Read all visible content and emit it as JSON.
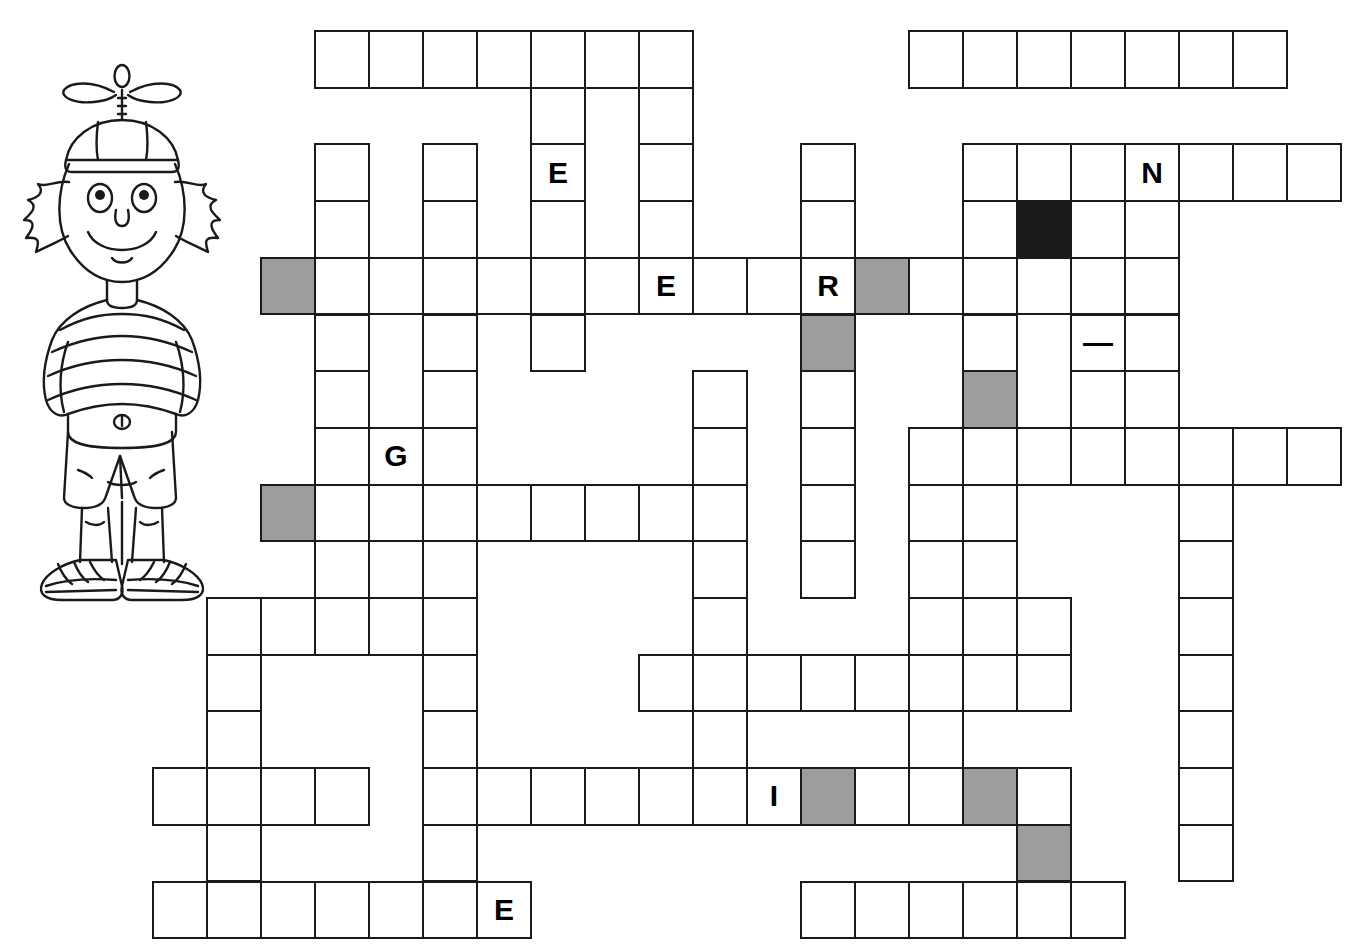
{
  "page": {
    "type": "blank crossword grid with partial letter hints"
  },
  "illustration": {
    "name": "cartoon-boy-with-propeller-hat",
    "description": "Line-art cartoon boy wearing a propeller beanie, striped t-shirt, shorts and sneakers"
  },
  "grid": {
    "cell_size": 54,
    "origin_x": 152,
    "origin_y": 30,
    "columns": 22,
    "rows": 16,
    "colors": {
      "cell_fill": "#ffffff",
      "cell_border": "#1a1a1a",
      "shaded_fill": "#9d9d9d",
      "blocked_fill": "#1a1a1a",
      "letter_color": "#000000"
    },
    "legend": {
      "shaded": "highlighted answer cell",
      "blocked": "blocked cell",
      "open": "empty answer cell"
    },
    "cells": [
      {
        "r": 0,
        "c": 3,
        "s": "open"
      },
      {
        "r": 0,
        "c": 4,
        "s": "open"
      },
      {
        "r": 0,
        "c": 5,
        "s": "open"
      },
      {
        "r": 0,
        "c": 6,
        "s": "open"
      },
      {
        "r": 0,
        "c": 7,
        "s": "open"
      },
      {
        "r": 0,
        "c": 8,
        "s": "open"
      },
      {
        "r": 0,
        "c": 9,
        "s": "open"
      },
      {
        "r": 0,
        "c": 14,
        "s": "open"
      },
      {
        "r": 0,
        "c": 15,
        "s": "open"
      },
      {
        "r": 0,
        "c": 16,
        "s": "open"
      },
      {
        "r": 0,
        "c": 17,
        "s": "open"
      },
      {
        "r": 0,
        "c": 18,
        "s": "open"
      },
      {
        "r": 0,
        "c": 19,
        "s": "open"
      },
      {
        "r": 0,
        "c": 20,
        "s": "open"
      },
      {
        "r": 1,
        "c": 7,
        "s": "open"
      },
      {
        "r": 1,
        "c": 9,
        "s": "open"
      },
      {
        "r": 2,
        "c": 3,
        "s": "open"
      },
      {
        "r": 2,
        "c": 5,
        "s": "open"
      },
      {
        "r": 2,
        "c": 7,
        "s": "open",
        "letter": "E"
      },
      {
        "r": 2,
        "c": 9,
        "s": "open"
      },
      {
        "r": 2,
        "c": 12,
        "s": "open"
      },
      {
        "r": 2,
        "c": 15,
        "s": "open"
      },
      {
        "r": 2,
        "c": 16,
        "s": "open"
      },
      {
        "r": 2,
        "c": 17,
        "s": "open"
      },
      {
        "r": 2,
        "c": 18,
        "s": "open",
        "letter": "N"
      },
      {
        "r": 2,
        "c": 19,
        "s": "open"
      },
      {
        "r": 2,
        "c": 20,
        "s": "open"
      },
      {
        "r": 2,
        "c": 21,
        "s": "open"
      },
      {
        "r": 3,
        "c": 3,
        "s": "open"
      },
      {
        "r": 3,
        "c": 5,
        "s": "open"
      },
      {
        "r": 3,
        "c": 7,
        "s": "open"
      },
      {
        "r": 3,
        "c": 9,
        "s": "open"
      },
      {
        "r": 3,
        "c": 12,
        "s": "open"
      },
      {
        "r": 3,
        "c": 15,
        "s": "open"
      },
      {
        "r": 3,
        "c": 16,
        "s": "blocked"
      },
      {
        "r": 3,
        "c": 17,
        "s": "open"
      },
      {
        "r": 3,
        "c": 18,
        "s": "open"
      },
      {
        "r": 4,
        "c": 2,
        "s": "shaded"
      },
      {
        "r": 4,
        "c": 3,
        "s": "open"
      },
      {
        "r": 4,
        "c": 4,
        "s": "open"
      },
      {
        "r": 4,
        "c": 5,
        "s": "open"
      },
      {
        "r": 4,
        "c": 6,
        "s": "open"
      },
      {
        "r": 4,
        "c": 7,
        "s": "open"
      },
      {
        "r": 4,
        "c": 8,
        "s": "open"
      },
      {
        "r": 4,
        "c": 9,
        "s": "open",
        "letter": "E"
      },
      {
        "r": 4,
        "c": 10,
        "s": "open"
      },
      {
        "r": 4,
        "c": 11,
        "s": "open"
      },
      {
        "r": 4,
        "c": 12,
        "s": "open",
        "letter": "R"
      },
      {
        "r": 4,
        "c": 13,
        "s": "shaded"
      },
      {
        "r": 4,
        "c": 14,
        "s": "open"
      },
      {
        "r": 4,
        "c": 15,
        "s": "open"
      },
      {
        "r": 4,
        "c": 16,
        "s": "open"
      },
      {
        "r": 4,
        "c": 17,
        "s": "open"
      },
      {
        "r": 4,
        "c": 18,
        "s": "open"
      },
      {
        "r": 5,
        "c": 3,
        "s": "open"
      },
      {
        "r": 5,
        "c": 5,
        "s": "open"
      },
      {
        "r": 5,
        "c": 7,
        "s": "open"
      },
      {
        "r": 5,
        "c": 12,
        "s": "shaded"
      },
      {
        "r": 5,
        "c": 15,
        "s": "open"
      },
      {
        "r": 5,
        "c": 17,
        "s": "open",
        "letter": "—"
      },
      {
        "r": 5,
        "c": 18,
        "s": "open"
      },
      {
        "r": 6,
        "c": 3,
        "s": "open"
      },
      {
        "r": 6,
        "c": 5,
        "s": "open"
      },
      {
        "r": 6,
        "c": 10,
        "s": "open"
      },
      {
        "r": 6,
        "c": 12,
        "s": "open"
      },
      {
        "r": 6,
        "c": 15,
        "s": "shaded"
      },
      {
        "r": 6,
        "c": 17,
        "s": "open"
      },
      {
        "r": 6,
        "c": 18,
        "s": "open"
      },
      {
        "r": 7,
        "c": 3,
        "s": "open"
      },
      {
        "r": 7,
        "c": 4,
        "s": "open",
        "letter": "G"
      },
      {
        "r": 7,
        "c": 5,
        "s": "open"
      },
      {
        "r": 7,
        "c": 10,
        "s": "open"
      },
      {
        "r": 7,
        "c": 12,
        "s": "open"
      },
      {
        "r": 7,
        "c": 14,
        "s": "open"
      },
      {
        "r": 7,
        "c": 15,
        "s": "open"
      },
      {
        "r": 7,
        "c": 16,
        "s": "open"
      },
      {
        "r": 7,
        "c": 17,
        "s": "open"
      },
      {
        "r": 7,
        "c": 18,
        "s": "open"
      },
      {
        "r": 7,
        "c": 19,
        "s": "open"
      },
      {
        "r": 7,
        "c": 20,
        "s": "open"
      },
      {
        "r": 7,
        "c": 21,
        "s": "open"
      },
      {
        "r": 8,
        "c": 2,
        "s": "shaded"
      },
      {
        "r": 8,
        "c": 3,
        "s": "open"
      },
      {
        "r": 8,
        "c": 4,
        "s": "open"
      },
      {
        "r": 8,
        "c": 5,
        "s": "open"
      },
      {
        "r": 8,
        "c": 6,
        "s": "open"
      },
      {
        "r": 8,
        "c": 7,
        "s": "open"
      },
      {
        "r": 8,
        "c": 8,
        "s": "open"
      },
      {
        "r": 8,
        "c": 9,
        "s": "open"
      },
      {
        "r": 8,
        "c": 10,
        "s": "open"
      },
      {
        "r": 8,
        "c": 12,
        "s": "open"
      },
      {
        "r": 8,
        "c": 14,
        "s": "open"
      },
      {
        "r": 8,
        "c": 15,
        "s": "open"
      },
      {
        "r": 8,
        "c": 19,
        "s": "open"
      },
      {
        "r": 9,
        "c": 3,
        "s": "open"
      },
      {
        "r": 9,
        "c": 5,
        "s": "open"
      },
      {
        "r": 9,
        "c": 10,
        "s": "open"
      },
      {
        "r": 9,
        "c": 12,
        "s": "open"
      },
      {
        "r": 9,
        "c": 14,
        "s": "open"
      },
      {
        "r": 9,
        "c": 15,
        "s": "open"
      },
      {
        "r": 9,
        "c": 19,
        "s": "open"
      },
      {
        "r": 10,
        "c": 1,
        "s": "open"
      },
      {
        "r": 10,
        "c": 2,
        "s": "open"
      },
      {
        "r": 10,
        "c": 3,
        "s": "open"
      },
      {
        "r": 10,
        "c": 4,
        "s": "open"
      },
      {
        "r": 10,
        "c": 5,
        "s": "open"
      },
      {
        "r": 10,
        "c": 10,
        "s": "open"
      },
      {
        "r": 10,
        "c": 14,
        "s": "open"
      },
      {
        "r": 10,
        "c": 15,
        "s": "open"
      },
      {
        "r": 10,
        "c": 16,
        "s": "open"
      },
      {
        "r": 10,
        "c": 19,
        "s": "open"
      },
      {
        "r": 11,
        "c": 1,
        "s": "open"
      },
      {
        "r": 11,
        "c": 5,
        "s": "open"
      },
      {
        "r": 11,
        "c": 9,
        "s": "open"
      },
      {
        "r": 11,
        "c": 10,
        "s": "open"
      },
      {
        "r": 11,
        "c": 11,
        "s": "open"
      },
      {
        "r": 11,
        "c": 12,
        "s": "open"
      },
      {
        "r": 11,
        "c": 13,
        "s": "open"
      },
      {
        "r": 11,
        "c": 14,
        "s": "open"
      },
      {
        "r": 11,
        "c": 15,
        "s": "open"
      },
      {
        "r": 11,
        "c": 16,
        "s": "open"
      },
      {
        "r": 11,
        "c": 19,
        "s": "open"
      },
      {
        "r": 12,
        "c": 1,
        "s": "open"
      },
      {
        "r": 12,
        "c": 5,
        "s": "open"
      },
      {
        "r": 12,
        "c": 10,
        "s": "open"
      },
      {
        "r": 12,
        "c": 14,
        "s": "open"
      },
      {
        "r": 12,
        "c": 19,
        "s": "open"
      },
      {
        "r": 13,
        "c": 0,
        "s": "open"
      },
      {
        "r": 13,
        "c": 1,
        "s": "open"
      },
      {
        "r": 13,
        "c": 2,
        "s": "open"
      },
      {
        "r": 13,
        "c": 3,
        "s": "open"
      },
      {
        "r": 13,
        "c": 5,
        "s": "open"
      },
      {
        "r": 13,
        "c": 6,
        "s": "open"
      },
      {
        "r": 13,
        "c": 7,
        "s": "open"
      },
      {
        "r": 13,
        "c": 8,
        "s": "open"
      },
      {
        "r": 13,
        "c": 9,
        "s": "open"
      },
      {
        "r": 13,
        "c": 10,
        "s": "open"
      },
      {
        "r": 13,
        "c": 11,
        "s": "open",
        "letter": "I"
      },
      {
        "r": 13,
        "c": 12,
        "s": "shaded"
      },
      {
        "r": 13,
        "c": 13,
        "s": "open"
      },
      {
        "r": 13,
        "c": 14,
        "s": "open"
      },
      {
        "r": 13,
        "c": 15,
        "s": "shaded"
      },
      {
        "r": 13,
        "c": 16,
        "s": "open"
      },
      {
        "r": 13,
        "c": 19,
        "s": "open"
      },
      {
        "r": 14,
        "c": 1,
        "s": "open"
      },
      {
        "r": 14,
        "c": 5,
        "s": "open"
      },
      {
        "r": 14,
        "c": 16,
        "s": "shaded"
      },
      {
        "r": 14,
        "c": 19,
        "s": "open"
      },
      {
        "r": 15,
        "c": 0,
        "s": "open"
      },
      {
        "r": 15,
        "c": 1,
        "s": "open"
      },
      {
        "r": 15,
        "c": 2,
        "s": "open"
      },
      {
        "r": 15,
        "c": 3,
        "s": "open"
      },
      {
        "r": 15,
        "c": 4,
        "s": "open"
      },
      {
        "r": 15,
        "c": 5,
        "s": "open"
      },
      {
        "r": 15,
        "c": 6,
        "s": "open",
        "letter": "E"
      },
      {
        "r": 15,
        "c": 12,
        "s": "open"
      },
      {
        "r": 15,
        "c": 13,
        "s": "open"
      },
      {
        "r": 15,
        "c": 14,
        "s": "open"
      },
      {
        "r": 15,
        "c": 15,
        "s": "open"
      },
      {
        "r": 15,
        "c": 16,
        "s": "open"
      },
      {
        "r": 15,
        "c": 17,
        "s": "open"
      }
    ]
  }
}
